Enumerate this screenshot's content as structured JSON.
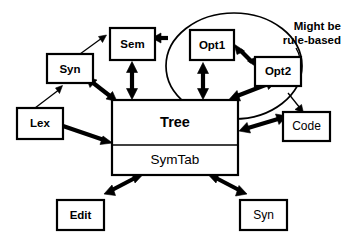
{
  "diagram": {
    "background_color": "#ffffff",
    "stroke_color": "#000000",
    "nodes": [
      {
        "id": "syn_top",
        "label": "Syn",
        "shape": "rectangle",
        "x": 47,
        "y": 54,
        "w": 46,
        "h": 29
      },
      {
        "id": "sem",
        "label": "Sem",
        "shape": "rectangle",
        "x": 110,
        "y": 28,
        "w": 45,
        "h": 32
      },
      {
        "id": "opt1",
        "label": "Opt1",
        "shape": "rectangle",
        "x": 190,
        "y": 30,
        "w": 44,
        "h": 30
      },
      {
        "id": "opt2",
        "label": "Opt2",
        "shape": "rectangle",
        "x": 255,
        "y": 57,
        "w": 46,
        "h": 29
      },
      {
        "id": "lex",
        "label": "Lex",
        "shape": "rectangle",
        "x": 17,
        "y": 108,
        "w": 46,
        "h": 31
      },
      {
        "id": "tree",
        "label": "Tree",
        "shape": "rectangle",
        "x": 112,
        "y": 100,
        "w": 126,
        "h": 45
      },
      {
        "id": "symtab",
        "label": "SymTab",
        "shape": "rectangle",
        "x": 112,
        "y": 145,
        "w": 126,
        "h": 30
      },
      {
        "id": "code",
        "label": "Code",
        "shape": "rectangle",
        "x": 283,
        "y": 112,
        "w": 47,
        "h": 29
      },
      {
        "id": "edit",
        "label": "Edit",
        "shape": "rectangle",
        "x": 57,
        "y": 200,
        "w": 47,
        "h": 30
      },
      {
        "id": "syn_bot",
        "label": "Syn",
        "shape": "rectangle",
        "x": 240,
        "y": 200,
        "w": 47,
        "h": 30
      }
    ],
    "group": {
      "id": "optimizer_group",
      "shape": "ellipse",
      "cx": 234,
      "cy": 66,
      "rx": 68,
      "ry": 53,
      "members": [
        "opt1",
        "opt2"
      ]
    },
    "annotation": {
      "id": "rule_based_note",
      "line1": "Might be",
      "line2": "rule-based",
      "points_to": "optimizer_group"
    },
    "edges": [
      {
        "from": "lex",
        "to": "syn_top",
        "style": "thin",
        "arrows": "single"
      },
      {
        "from": "syn_top",
        "to": "sem",
        "style": "thin",
        "arrows": "single"
      },
      {
        "from": "sem",
        "to": "tree",
        "style": "thick",
        "arrows": "double"
      },
      {
        "from": "syn_top",
        "to": "tree",
        "style": "thick",
        "arrows": "double"
      },
      {
        "from": "lex",
        "to": "tree",
        "style": "thick",
        "arrows": "single"
      },
      {
        "from": "sem",
        "to": "opt1",
        "style": "thick",
        "arrows": "single"
      },
      {
        "from": "opt1",
        "to": "opt2",
        "style": "thick",
        "arrows": "double"
      },
      {
        "from": "opt1",
        "to": "tree",
        "style": "thick",
        "arrows": "double"
      },
      {
        "from": "opt2",
        "to": "tree",
        "style": "thick",
        "arrows": "double"
      },
      {
        "from": "tree",
        "to": "code",
        "style": "thick",
        "arrows": "double"
      },
      {
        "from": "symtab",
        "to": "edit",
        "style": "thick",
        "arrows": "double"
      },
      {
        "from": "symtab",
        "to": "syn_bot",
        "style": "thick",
        "arrows": "double"
      }
    ]
  }
}
